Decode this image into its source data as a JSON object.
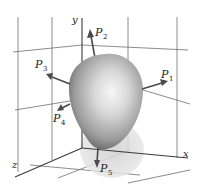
{
  "figure": {
    "axes": {
      "x_label": "x",
      "y_label": "y",
      "z_label": "z"
    },
    "points": [
      {
        "name": "P",
        "sub": "1",
        "direction": "right"
      },
      {
        "name": "P",
        "sub": "2",
        "direction": "up"
      },
      {
        "name": "P",
        "sub": "3",
        "direction": "upper-left"
      },
      {
        "name": "P",
        "sub": "4",
        "direction": "lower-left"
      },
      {
        "name": "P",
        "sub": "5",
        "direction": "down"
      }
    ],
    "colors": {
      "surface_light": "#f4f4f4",
      "surface_mid": "#b4b4b4",
      "surface_dark": "#5a5a5a",
      "shadow": "#d6d6d6",
      "grid": "#6e6e6e",
      "background": "#ffffff"
    }
  }
}
